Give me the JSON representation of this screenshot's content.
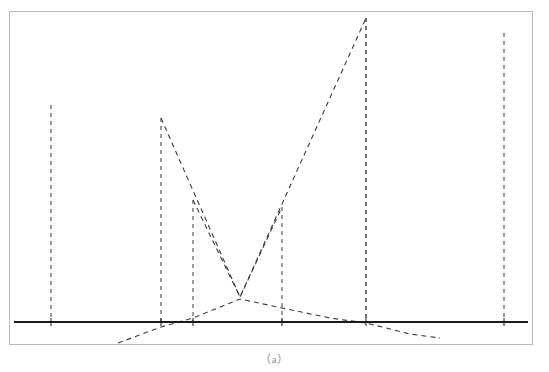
{
  "figure": {
    "caption": "（a）",
    "caption_plain": "(a)",
    "frame": {
      "x": 9,
      "y": 11,
      "width": 524,
      "height": 334,
      "border_color": "#b9b9b9"
    },
    "background_color": "#ffffff"
  },
  "chart_data": {
    "type": "line",
    "title": "",
    "subtitle": "",
    "xlabel": "",
    "ylabel": "",
    "grid": false,
    "legend_position": "none",
    "axis": {
      "baseline_y_px": 322,
      "baseline_x_start_px": 14,
      "baseline_x_end_px": 528,
      "baseline_color": "#1a1a1a",
      "baseline_width_px": 2,
      "tick_marks_visible": true
    },
    "styles": {
      "stem_color": "#4a4a55",
      "stem_dash": "4,4",
      "stem_width_px": 1.1,
      "envelope_color": "#3a3a44",
      "envelope_dash": "5,4",
      "envelope_width_px": 1.1
    },
    "stems": {
      "note": "dashed vertical impulse lines; x in px, top_y in px, baseline at y=322",
      "x": [
        51,
        161,
        193,
        282,
        366,
        504
      ],
      "top_y": [
        105,
        118,
        200,
        207,
        18,
        33
      ],
      "heights_px": [
        217,
        204,
        122,
        115,
        304,
        289
      ]
    },
    "series": [
      {
        "name": "envelope-upper",
        "description": "dashed polyline connecting stem tops through a low valley",
        "points_px": [
          [
            161,
            118
          ],
          [
            240,
            297
          ],
          [
            366,
            18
          ]
        ]
      },
      {
        "name": "envelope-secondary",
        "description": "dashed polyline from stem top at x=193 down to the valley and on up",
        "points_px": [
          [
            193,
            200
          ],
          [
            240,
            297
          ],
          [
            282,
            207
          ]
        ]
      },
      {
        "name": "baseline-arc",
        "description": "shallow dashed arc below the stems peaking near the valley",
        "points_px": [
          [
            118,
            343
          ],
          [
            161,
            327
          ],
          [
            193,
            318
          ],
          [
            240,
            299
          ],
          [
            282,
            308
          ],
          [
            330,
            318
          ],
          [
            366,
            323
          ],
          [
            410,
            334
          ],
          [
            440,
            338
          ]
        ]
      }
    ],
    "xlim_px": [
      14,
      528
    ],
    "ylim_px": [
      14,
      342
    ]
  }
}
